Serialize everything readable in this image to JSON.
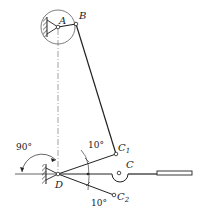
{
  "diagram": {
    "type": "linkage-mechanism",
    "points": {
      "A": "A",
      "B": "B",
      "C": "C",
      "C1": {
        "base": "C",
        "sub": "1"
      },
      "C2": {
        "base": "C",
        "sub": "2"
      },
      "D": "D"
    },
    "angles": {
      "right_angle": "90°",
      "upper": "10°",
      "lower": "10°"
    },
    "colors": {
      "line": "#222222",
      "center_line": "#555555"
    }
  }
}
